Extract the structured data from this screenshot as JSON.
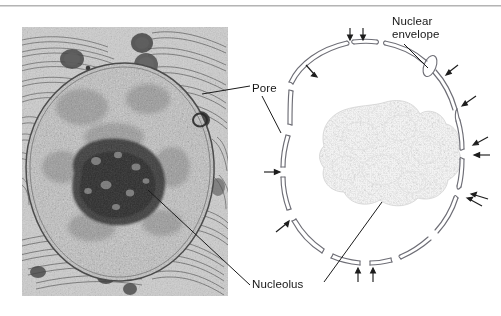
{
  "figure": {
    "type": "biology-figure",
    "panels": [
      {
        "name": "electron-micrograph",
        "kind": "transmission-electron-micrograph",
        "subject": "nucleus surrounded by rough endoplasmic reticulum"
      },
      {
        "name": "line-drawing",
        "kind": "interpretive-diagram",
        "subject": "nuclear envelope shown as a double membrane interrupted by pores"
      }
    ]
  },
  "labels": {
    "pore": "Pore",
    "nucleolus": "Nucleolus",
    "nuclear_envelope_line1": "Nuclear",
    "nuclear_envelope_line2": "envelope"
  },
  "colors": {
    "background": "#ffffff",
    "text": "#161616",
    "leader_line": "#1a1a1a",
    "rule": "#b4b4b4",
    "membrane_line": "#6e6e76",
    "nucleolus_fill": "#ededed",
    "micrograph_dark": "#2b2b2b",
    "micrograph_light": "#d9d9d9"
  },
  "diagram": {
    "envelope_gaps_marked_by_arrows": 13,
    "arrow_glyph": "arrow",
    "nucleolus_shape": "stippled-irregular-blob"
  }
}
